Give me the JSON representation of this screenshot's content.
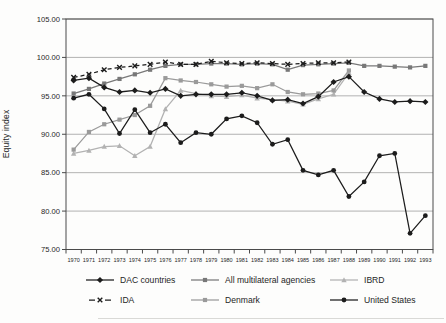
{
  "figure": {
    "kind": "scanned line chart figure",
    "background": "#fdfdfc",
    "text_color": "#1f1f1f",
    "grid_color": "#9f9f9f",
    "axis_color": "#4a4a4a"
  },
  "chart_data": {
    "type": "line",
    "title": "",
    "xlabel": "",
    "ylabel": "Equity index",
    "ylim": [
      75,
      105
    ],
    "grid": "horizontal",
    "legend_position": "bottom",
    "y_ticks": [
      105,
      100,
      95,
      90,
      85,
      80,
      75
    ],
    "y_tick_labels": [
      "105.00",
      "100.00",
      "95.00",
      "90.00",
      "85.00",
      "80.00",
      "75.00"
    ],
    "categories": [
      "1970",
      "1971",
      "1972",
      "1973",
      "1974",
      "1975",
      "1976",
      "1977",
      "1978",
      "1979",
      "1980",
      "1981",
      "1982",
      "1983",
      "1984",
      "1985",
      "1986",
      "1987",
      "1988",
      "1989",
      "1990",
      "1991",
      "1992",
      "1993"
    ],
    "series": [
      {
        "name": "DAC countries",
        "slug": "dac-countries",
        "marker": "diamond",
        "color": "#1c1c1c",
        "dash": null,
        "values": [
          97.0,
          97.3,
          96.1,
          95.5,
          95.7,
          95.4,
          95.9,
          95.0,
          95.2,
          95.2,
          95.2,
          95.4,
          95.0,
          94.4,
          94.5,
          94.0,
          94.9,
          96.8,
          97.5,
          95.5,
          94.6,
          94.2,
          94.3,
          94.2
        ]
      },
      {
        "name": "All multilateral agencies",
        "slug": "all-multilateral-agencies",
        "marker": "square",
        "color": "#787878",
        "dash": null,
        "values": [
          95.3,
          95.9,
          96.6,
          97.2,
          97.8,
          98.4,
          98.9,
          99.1,
          99.1,
          99.2,
          99.2,
          99.1,
          99.2,
          99.1,
          98.4,
          99.0,
          99.1,
          99.2,
          99.3,
          98.9,
          98.9,
          98.8,
          98.7,
          98.9
        ]
      },
      {
        "name": "IBRD",
        "slug": "ibrd",
        "marker": "triangle",
        "color": "#b2b2b2",
        "dash": null,
        "values": [
          87.5,
          87.9,
          88.4,
          88.5,
          87.2,
          88.4,
          93.3,
          95.7,
          95.3,
          95.0,
          94.9,
          95.1,
          94.7,
          94.5,
          94.3,
          93.9,
          94.6,
          95.2,
          98.0,
          null,
          null,
          null,
          null,
          null
        ]
      },
      {
        "name": "IDA",
        "slug": "ida",
        "marker": "x",
        "color": "#1c1c1c",
        "dash": "4 3",
        "values": [
          97.4,
          97.8,
          98.4,
          98.7,
          98.9,
          99.1,
          99.4,
          99.1,
          99.1,
          99.5,
          99.3,
          99.2,
          99.3,
          99.2,
          99.1,
          99.2,
          99.3,
          99.3,
          99.4,
          null,
          null,
          null,
          null,
          null
        ]
      },
      {
        "name": "Denmark",
        "slug": "denmark",
        "marker": "square",
        "color": "#9a9a9a",
        "dash": null,
        "values": [
          88.0,
          90.3,
          91.3,
          91.9,
          92.5,
          93.7,
          97.3,
          97.0,
          96.8,
          96.5,
          96.2,
          96.3,
          96.0,
          96.5,
          95.5,
          95.2,
          95.3,
          95.7,
          98.3,
          null,
          null,
          null,
          null,
          null
        ]
      },
      {
        "name": "United States",
        "slug": "united-states",
        "marker": "circle",
        "color": "#1c1c1c",
        "dash": null,
        "values": [
          94.7,
          95.2,
          93.3,
          90.1,
          93.2,
          90.2,
          91.3,
          88.9,
          90.2,
          90.0,
          92.0,
          92.4,
          91.5,
          88.7,
          89.3,
          85.3,
          84.7,
          85.3,
          81.9,
          83.8,
          87.2,
          87.5,
          77.1,
          79.4
        ]
      }
    ]
  },
  "legend": {
    "order": [
      "dac-countries",
      "all-multilateral-agencies",
      "ibrd",
      "ida",
      "denmark",
      "united-states"
    ],
    "columns_x": [
      86,
      191,
      330
    ],
    "rows_y": [
      272,
      292
    ]
  }
}
